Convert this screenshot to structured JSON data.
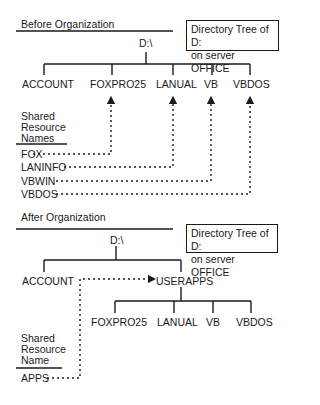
{
  "before": {
    "title": "Before Organization",
    "box": {
      "line1": "Directory Tree of D:",
      "line2": "on server OFFICE"
    },
    "root": "D:\\",
    "folders": [
      "ACCOUNT",
      "FOXPRO25",
      "LANUAL",
      "VB",
      "VBDOS"
    ],
    "shares_header": [
      "Shared",
      "Resource",
      "Names"
    ],
    "shares": [
      {
        "name": "FOX",
        "maps_to": "FOXPRO25"
      },
      {
        "name": "LANINFO",
        "maps_to": "LANUAL"
      },
      {
        "name": "VBWIN",
        "maps_to": "VB"
      },
      {
        "name": "VBDOS",
        "maps_to": "VBDOS"
      }
    ]
  },
  "after": {
    "title": "After Organization",
    "box": {
      "line1": "Directory Tree of D:",
      "line2": "on server OFFICE"
    },
    "root": "D:\\",
    "level1": [
      "ACCOUNT",
      "USERAPPS"
    ],
    "userapps_children": [
      "FOXPRO25",
      "LANUAL",
      "VB",
      "VBDOS"
    ],
    "shares_header": [
      "Shared",
      "Resource",
      "Name"
    ],
    "shares": [
      {
        "name": "APPS",
        "maps_to": "USERAPPS"
      }
    ]
  }
}
